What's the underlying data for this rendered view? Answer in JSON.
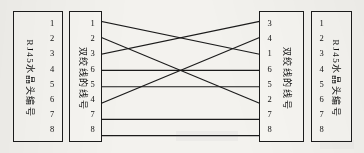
{
  "figure": {
    "ink_color": "#1b1b1b",
    "paper_color": "#f3f2ee"
  },
  "panels": [
    {
      "id": "left-connector",
      "label": "RJ45水晶头编号",
      "label_position": "left",
      "pins": [
        "1",
        "2",
        "3",
        "4",
        "5",
        "6",
        "7",
        "8"
      ]
    },
    {
      "id": "left-wire-numbers",
      "label": "双绞线的线号",
      "label_position": "left",
      "pins": [
        "1",
        "2",
        "3",
        "6",
        "5",
        "4",
        "7",
        "8"
      ]
    },
    {
      "id": "right-wire-numbers",
      "label": "双绞线的线号",
      "label_position": "right",
      "pins": [
        "3",
        "4",
        "1",
        "6",
        "5",
        "2",
        "7",
        "8"
      ]
    },
    {
      "id": "right-connector",
      "label": "RJ45水晶头编号",
      "label_position": "right",
      "pins": [
        "1",
        "2",
        "3",
        "4",
        "5",
        "6",
        "7",
        "8"
      ]
    }
  ],
  "connections": [
    {
      "from_row": 1,
      "to_row": 3,
      "from_value": "1",
      "to_value": "1"
    },
    {
      "from_row": 2,
      "to_row": 6,
      "from_value": "2",
      "to_value": "2"
    },
    {
      "from_row": 3,
      "to_row": 1,
      "from_value": "3",
      "to_value": "3"
    },
    {
      "from_row": 4,
      "to_row": 4,
      "from_value": "6",
      "to_value": "6"
    },
    {
      "from_row": 5,
      "to_row": 5,
      "from_value": "5",
      "to_value": "5"
    },
    {
      "from_row": 6,
      "to_row": 2,
      "from_value": "4",
      "to_value": "4"
    },
    {
      "from_row": 7,
      "to_row": 7,
      "from_value": "7",
      "to_value": "7"
    },
    {
      "from_row": 8,
      "to_row": 8,
      "from_value": "8",
      "to_value": "8"
    }
  ]
}
